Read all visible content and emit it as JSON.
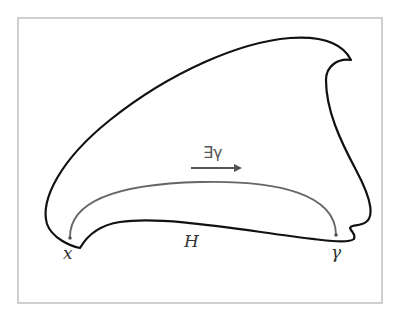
{
  "diagram": {
    "labels": {
      "start_point": "x",
      "region": "H",
      "end_point": "γ",
      "path_annotation": "∃γ"
    },
    "colors": {
      "frame": "#cfcfcf",
      "outline": "#111111",
      "path": "#666666",
      "arrow": "#555555",
      "text": "#333333"
    }
  }
}
